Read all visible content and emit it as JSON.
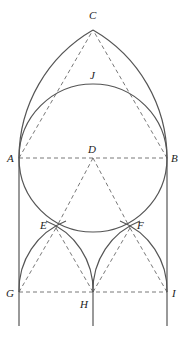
{
  "diagram": {
    "type": "geometric-construction",
    "points": {
      "A": {
        "label": "A",
        "x": 19,
        "y": 158
      },
      "B": {
        "label": "B",
        "x": 167,
        "y": 158
      },
      "C": {
        "label": "C",
        "x": 93,
        "y": 30
      },
      "D": {
        "label": "D",
        "x": 93,
        "y": 158
      },
      "E": {
        "label": "E",
        "x": 56,
        "y": 228
      },
      "F": {
        "label": "F",
        "x": 130,
        "y": 228
      },
      "G": {
        "label": "G",
        "x": 19,
        "y": 292
      },
      "H": {
        "label": "H",
        "x": 93,
        "y": 292
      },
      "I": {
        "label": "I",
        "x": 167,
        "y": 292
      },
      "J": {
        "label": "J",
        "x": 93,
        "y": 84
      }
    },
    "colors": {
      "stroke": "#555555",
      "label": "#222222",
      "background": "#ffffff"
    }
  }
}
